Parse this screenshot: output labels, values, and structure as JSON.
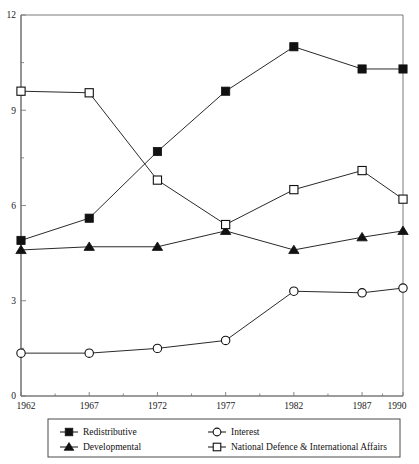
{
  "chart_data": {
    "type": "line",
    "title": "",
    "subtitle": "",
    "xlabel": "",
    "ylabel": "",
    "x": [
      1962,
      1967,
      1972,
      1977,
      1982,
      1987,
      1990
    ],
    "xtick_labels": [
      "1962",
      "1967",
      "1972",
      "1977",
      "1982",
      "1987",
      "1990"
    ],
    "ytick_labels": [
      "0",
      "3",
      "6",
      "9",
      "12"
    ],
    "ytick_values": [
      0,
      3,
      6,
      9,
      12
    ],
    "ylim": [
      0,
      12
    ],
    "xlim": [
      1962,
      1990
    ],
    "grid": false,
    "minor_ticks": true,
    "legend_position": "bottom-outside",
    "series": [
      {
        "name": "Redistributive",
        "marker": "filled-square",
        "values": [
          4.9,
          5.6,
          7.7,
          9.6,
          11.0,
          10.3,
          10.3
        ]
      },
      {
        "name": "Developmental",
        "marker": "filled-triangle",
        "values": [
          4.6,
          4.7,
          4.7,
          5.2,
          4.6,
          5.0,
          5.2
        ]
      },
      {
        "name": "Interest",
        "marker": "open-circle",
        "values": [
          1.35,
          1.35,
          1.5,
          1.75,
          3.3,
          3.25,
          3.4
        ]
      },
      {
        "name": "National Defence & International Affairs",
        "marker": "open-square",
        "values": [
          9.6,
          9.55,
          6.8,
          5.4,
          6.5,
          7.1,
          6.2
        ]
      }
    ]
  },
  "legend": {
    "entries": [
      {
        "label": "Redistributive",
        "marker": "filled-square"
      },
      {
        "label": "Interest",
        "marker": "open-circle"
      },
      {
        "label": "Developmental",
        "marker": "filled-triangle"
      },
      {
        "label": "National Defence & International Affairs",
        "marker": "open-square"
      }
    ]
  },
  "colors": {
    "ink": "#111111",
    "axis": "#3b3b3b",
    "frame": "#6b6b6b",
    "background": "#ffffff"
  }
}
